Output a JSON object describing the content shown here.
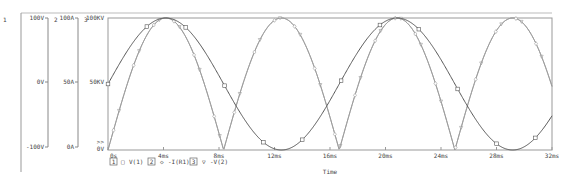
{
  "chart_data": {
    "type": "line",
    "title": "",
    "xlabel": "Time",
    "x_ticks": [
      "0s",
      "4ms",
      "8ms",
      "12ms",
      "16ms",
      "20ms",
      "24ms",
      "28ms",
      "32ms"
    ],
    "xlim_ms": [
      0,
      32
    ],
    "grid": false,
    "axes": [
      {
        "id": "1",
        "min_label": "-100V",
        "mid_label": "0V",
        "max_label": "100V",
        "range": [
          -100,
          100
        ],
        "unit": "V"
      },
      {
        "id": "2",
        "min_label": "0A",
        "mid_label": "50A",
        "max_label": "100A",
        "range": [
          0,
          100
        ],
        "unit": "A"
      },
      {
        "id": "3",
        "min_label": "0V",
        "mid_label": "50KV",
        "max_label": "100KV",
        "range": [
          0,
          100000
        ],
        "unit": "V"
      }
    ],
    "axis3_marker": ">>",
    "legend_position": "bottom-left",
    "series": [
      {
        "axis": "1",
        "name": "V(1)",
        "marker": "square",
        "shape": "sine",
        "frequency_hz": 60,
        "amplitude": 100,
        "offset": 0,
        "color": "#555555",
        "samples_ms": [
          0,
          2,
          4.17,
          6,
          8.33,
          10,
          12.5,
          14,
          16.67,
          18,
          20.83,
          22,
          25,
          27,
          29.17,
          31,
          32
        ],
        "values": [
          0,
          67,
          100,
          79,
          0,
          -58,
          -100,
          -87,
          0,
          48,
          100,
          89,
          0,
          -69,
          -100,
          -71,
          -48
        ]
      },
      {
        "axis": "2",
        "name": "-I(R1)",
        "marker": "diamond",
        "shape": "rectified-sine",
        "frequency_hz": 60,
        "amplitude": 100,
        "color": "#9a9a9a",
        "samples_ms": [
          0,
          2,
          4.17,
          6,
          8.33,
          10,
          12.5,
          14,
          16.67,
          18,
          20.83,
          22,
          25,
          27,
          29.17,
          31,
          32
        ],
        "values": [
          0,
          67,
          100,
          79,
          0,
          58,
          100,
          87,
          0,
          48,
          100,
          89,
          0,
          69,
          100,
          71,
          48
        ]
      },
      {
        "axis": "3",
        "name": "-V(2)",
        "marker": "triangle-down",
        "shape": "rectified-sine",
        "frequency_hz": 60,
        "amplitude": 100000,
        "color": "#9a9a9a",
        "samples_ms": [
          0,
          2,
          4.17,
          6,
          8.33,
          10,
          12.5,
          14,
          16.67,
          18,
          20.83,
          22,
          25,
          27,
          29.17,
          31,
          32
        ],
        "values": [
          0,
          67000,
          100000,
          79000,
          0,
          58000,
          100000,
          87000,
          0,
          48000,
          100000,
          89000,
          0,
          69000,
          100000,
          71000,
          48000
        ]
      }
    ]
  },
  "legend": [
    {
      "index": "1",
      "symbol": "□",
      "label": "V(1)"
    },
    {
      "index": "2",
      "symbol": "◇",
      "label": "-I(R1)"
    },
    {
      "index": "3",
      "symbol": "▽",
      "label": "-V(2)"
    }
  ],
  "axis_ids": {
    "a1": "1",
    "a2": "2",
    "a3": "3"
  }
}
